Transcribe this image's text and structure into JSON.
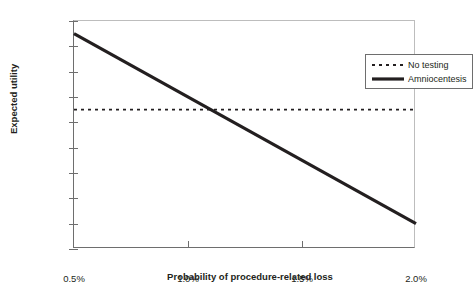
{
  "chart_data": {
    "type": "line",
    "title": "",
    "xlabel": "Probability of procedure-related loss",
    "ylabel": "Expected utility",
    "xlim": [
      0.5,
      2.0
    ],
    "ylim": [
      97.2,
      99.0
    ],
    "grid": false,
    "legend_position": "top-right",
    "x_tick_labels": [
      "0.5%",
      "1.0%",
      "1.5%",
      "2.0%"
    ],
    "x_tick_values": [
      0.5,
      1.0,
      1.5,
      2.0
    ],
    "y_tick_labels": [
      "97.2",
      "97.4",
      "97.6",
      "97.8",
      "98.0",
      "98.2",
      "98.4",
      "98.6",
      "98.8",
      "99.0"
    ],
    "y_tick_values": [
      97.2,
      97.4,
      97.6,
      97.8,
      98.0,
      98.2,
      98.4,
      98.6,
      98.8,
      99.0
    ],
    "series": [
      {
        "name": "No testing",
        "style": "dashed",
        "color": "#231f20",
        "width": 1.6,
        "x": [
          0.5,
          2.0
        ],
        "values": [
          98.3,
          98.3
        ]
      },
      {
        "name": "Amniocentesis",
        "style": "solid",
        "color": "#231f20",
        "width": 3.2,
        "x": [
          0.5,
          2.0
        ],
        "values": [
          98.9,
          97.4
        ]
      }
    ],
    "annotations": [
      {
        "label": "crossover",
        "x": 1.1,
        "y": 98.3
      }
    ]
  },
  "legend": {
    "entries": [
      {
        "label": "No testing"
      },
      {
        "label": "Amniocentesis"
      }
    ]
  },
  "colors": {
    "ink": "#231f20",
    "axis_dark": "#6e6e6e",
    "axis_light": "#bdbdbd",
    "background": "#ffffff"
  }
}
